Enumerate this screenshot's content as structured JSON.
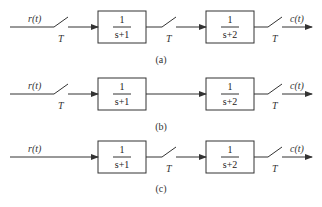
{
  "diagrams": [
    {
      "id": "a",
      "caption": "(a)",
      "input": "r(t)",
      "output": "c(t)",
      "sampler_label": "T",
      "blocks": [
        {
          "num": "1",
          "den": "s+1"
        },
        {
          "num": "1",
          "den": "s+2"
        }
      ],
      "samplers": [
        "input",
        "between",
        "output"
      ]
    },
    {
      "id": "b",
      "caption": "(b)",
      "input": "r(t)",
      "output": "c(t)",
      "sampler_label": "T",
      "blocks": [
        {
          "num": "1",
          "den": "s+1"
        },
        {
          "num": "1",
          "den": "s+2"
        }
      ],
      "samplers": [
        "input",
        "output"
      ]
    },
    {
      "id": "c",
      "caption": "(c)",
      "input": "r(t)",
      "output": "c(t)",
      "sampler_label": "T",
      "blocks": [
        {
          "num": "1",
          "den": "s+1"
        },
        {
          "num": "1",
          "den": "s+2"
        }
      ],
      "samplers": [
        "between",
        "output"
      ]
    }
  ]
}
